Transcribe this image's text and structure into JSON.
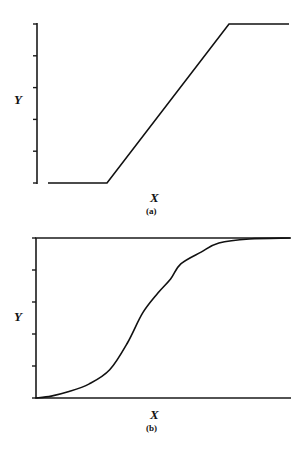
{
  "chart_data": [
    {
      "type": "line",
      "panel_label": "(a)",
      "xlabel": "X",
      "ylabel": "Y",
      "title": "",
      "description": "Piecewise linear response: flat minimum, linear rise, flat maximum",
      "xlim": [
        0,
        1
      ],
      "ylim": [
        0,
        5
      ],
      "y_ticks": [
        0,
        1,
        2,
        3,
        4,
        5
      ],
      "y_tick_labels": [
        "",
        "",
        "",
        "",
        "",
        ""
      ],
      "grid": false,
      "box": false,
      "series": [
        {
          "name": "threshold-linear",
          "x": [
            0,
            0.245,
            0.751,
            1.0
          ],
          "y": [
            0,
            0,
            5,
            5
          ]
        }
      ]
    },
    {
      "type": "line",
      "panel_label": "(b)",
      "xlabel": "X",
      "ylabel": "Y",
      "title": "",
      "description": "Sigmoidal (S-shaped) response curve",
      "xlim": [
        0,
        1
      ],
      "ylim": [
        0,
        5
      ],
      "y_ticks": [
        0,
        1,
        2,
        3,
        4,
        5
      ],
      "y_tick_labels": [
        "",
        "",
        "",
        "",
        "",
        ""
      ],
      "grid": false,
      "box": "top-and-bottom horizontal lines",
      "series": [
        {
          "name": "sigmoid",
          "x": [
            0.0,
            0.06,
            0.13,
            0.21,
            0.29,
            0.36,
            0.42,
            0.48,
            0.53,
            0.57,
            0.65,
            0.72,
            0.84,
            1.0
          ],
          "y": [
            0.0,
            0.06,
            0.2,
            0.44,
            0.88,
            1.72,
            2.66,
            3.28,
            3.72,
            4.19,
            4.56,
            4.84,
            4.97,
            5.0
          ]
        }
      ]
    }
  ]
}
